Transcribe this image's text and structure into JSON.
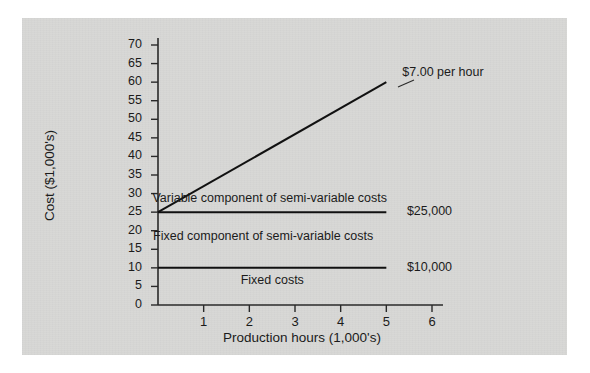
{
  "chart_data": {
    "type": "line",
    "title": "",
    "xlabel": "Production hours (1,000's)",
    "ylabel": "Cost ($1,000's)",
    "xlim": [
      0,
      6.25
    ],
    "ylim": [
      0,
      72
    ],
    "grid": false,
    "legend_position": "none",
    "x_ticks": [
      "1",
      "2",
      "3",
      "4",
      "5",
      "6"
    ],
    "x_tick_values": [
      1,
      2,
      3,
      4,
      5,
      6
    ],
    "y_ticks": [
      "0",
      "5",
      "10",
      "15",
      "20",
      "25",
      "30",
      "35",
      "40",
      "45",
      "50",
      "55",
      "60",
      "65",
      "70"
    ],
    "y_tick_values": [
      0,
      5,
      10,
      15,
      20,
      25,
      30,
      35,
      40,
      45,
      50,
      55,
      60,
      65,
      70
    ],
    "series": [
      {
        "name": "Fixed costs",
        "kind": "horizontal-line",
        "value": 10,
        "x": [
          0,
          5
        ],
        "values": [
          10,
          10
        ],
        "end_label": "$10,000"
      },
      {
        "name": "Fixed plus fixed component of semi-variable costs",
        "kind": "horizontal-line",
        "value": 25,
        "x": [
          0,
          5
        ],
        "values": [
          25,
          25
        ],
        "end_label": "$25,000"
      },
      {
        "name": "Total semi-variable cost line",
        "kind": "sloped-line",
        "x": [
          0,
          5
        ],
        "values": [
          25,
          60
        ],
        "slope_per_unit": 7,
        "end_label": "$7.00 per hour"
      }
    ],
    "annotations": [
      {
        "text": "Variable component of semi-variable costs",
        "x": 2.45,
        "y": 28.6
      },
      {
        "text": "Fixed component of semi-variable costs",
        "x": 2.3,
        "y": 18.2
      },
      {
        "text": "Fixed costs",
        "x": 2.5,
        "y": 6.4
      },
      {
        "text": "$25,000",
        "x": 5.45,
        "y": 25
      },
      {
        "text": "$10,000",
        "x": 5.45,
        "y": 10
      },
      {
        "text": "$7.00 per hour",
        "x": 5.35,
        "y": 62.5
      }
    ]
  },
  "colors": {
    "panel_background": "#d8d8d6",
    "page_background": "#ffffff",
    "line": "#111111",
    "axis": "#2a2a2a",
    "text": "#1b1b1b"
  }
}
